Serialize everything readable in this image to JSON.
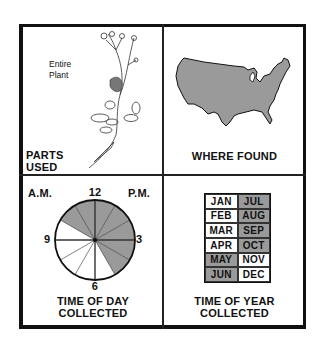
{
  "panels": {
    "parts_used": {
      "title_line1": "PARTS",
      "title_line2": "USED",
      "note_line1": "Entire",
      "note_line2": "Plant",
      "illustration": "plant-drawing"
    },
    "where_found": {
      "title": "WHERE FOUND",
      "illustration": "us-map",
      "fill_color": "#9a9a9a"
    },
    "time_of_day": {
      "title_line1": "TIME OF DAY",
      "title_line2": "COLLECTED",
      "am_label": "A.M.",
      "pm_label": "P.M.",
      "hour_labels": {
        "top": "12",
        "right": "3",
        "bottom": "6",
        "left": "9"
      },
      "shaded_hours": [
        10,
        11,
        12,
        1,
        2,
        3,
        4
      ],
      "shaded_color": "#9a9a9a"
    },
    "time_of_year": {
      "title_line1": "TIME OF YEAR",
      "title_line2": "COLLECTED",
      "months": [
        {
          "label": "JAN",
          "shaded": false
        },
        {
          "label": "JUL",
          "shaded": true
        },
        {
          "label": "FEB",
          "shaded": false
        },
        {
          "label": "AUG",
          "shaded": true
        },
        {
          "label": "MAR",
          "shaded": false
        },
        {
          "label": "SEP",
          "shaded": true
        },
        {
          "label": "APR",
          "shaded": false
        },
        {
          "label": "OCT",
          "shaded": true
        },
        {
          "label": "MAY",
          "shaded": true
        },
        {
          "label": "NOV",
          "shaded": false
        },
        {
          "label": "JUN",
          "shaded": true
        },
        {
          "label": "DEC",
          "shaded": false
        }
      ],
      "shaded_color": "#9a9a9a"
    }
  }
}
